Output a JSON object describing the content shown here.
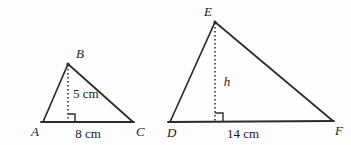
{
  "figure": {
    "background_color": "#fdfdfd",
    "stroke_color": "#2b2b2b",
    "text_color": "#1a1a1a",
    "triangles": [
      {
        "name": "triangle-abc",
        "vertices": {
          "apex": {
            "label": "B",
            "x": 68,
            "y": 64
          },
          "left": {
            "label": "A",
            "x": 43,
            "y": 122
          },
          "right": {
            "label": "C",
            "x": 133,
            "y": 122
          }
        },
        "altitude": {
          "label": "5 cm",
          "value": 5,
          "unit": "cm",
          "style": "dashed",
          "foot_x": 68
        },
        "base": {
          "label": "8 cm",
          "value": 8,
          "unit": "cm"
        },
        "right_angle_marker": true
      },
      {
        "name": "triangle-def",
        "vertices": {
          "apex": {
            "label": "E",
            "x": 215,
            "y": 22
          },
          "left": {
            "label": "D",
            "x": 170,
            "y": 122
          },
          "right": {
            "label": "F",
            "x": 333,
            "y": 121
          }
        },
        "altitude": {
          "label": "h",
          "value": null,
          "unit": "",
          "style": "dashed",
          "foot_x": 215
        },
        "base": {
          "label": "14 cm",
          "value": 14,
          "unit": "cm"
        },
        "right_angle_marker": true
      }
    ]
  }
}
